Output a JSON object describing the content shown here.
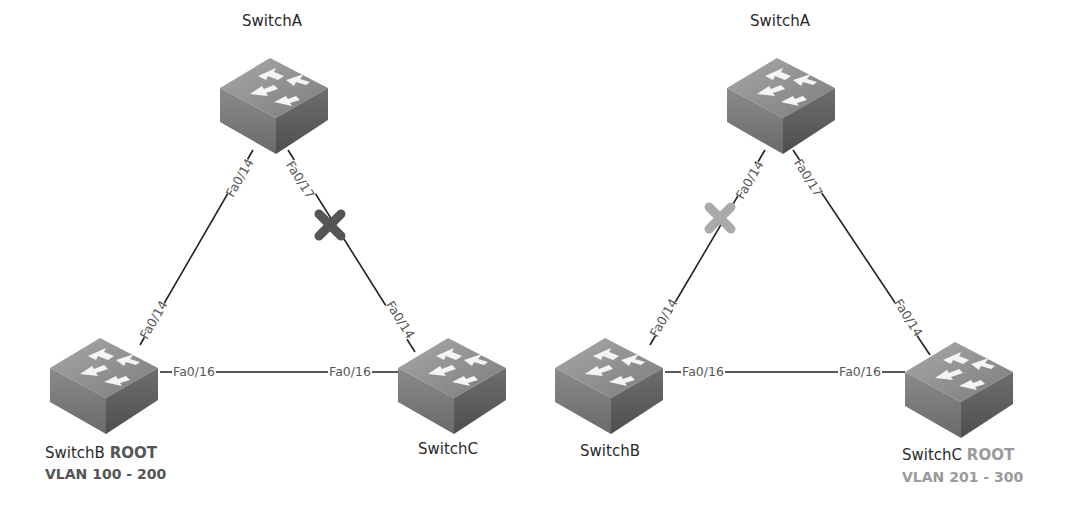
{
  "diagrams": [
    {
      "id": "left",
      "root_switch": "SwitchB",
      "root_vlan_range": "VLAN 100 - 200",
      "switches": [
        {
          "name": "SwitchA",
          "label": "SwitchA"
        },
        {
          "name": "SwitchB",
          "label": "SwitchB",
          "root_tag": "ROOT",
          "vlan": "VLAN 100 - 200"
        },
        {
          "name": "SwitchC",
          "label": "SwitchC"
        }
      ],
      "links": [
        {
          "from": "SwitchA",
          "from_port": "Fa0/14",
          "to": "SwitchB",
          "to_port": "Fa0/14",
          "blocked": false
        },
        {
          "from": "SwitchA",
          "from_port": "Fa0/17",
          "to": "SwitchC",
          "to_port": "Fa0/14",
          "blocked": true,
          "block_color": "#555555"
        },
        {
          "from": "SwitchB",
          "from_port": "Fa0/16",
          "to": "SwitchC",
          "to_port": "Fa0/16",
          "blocked": false
        }
      ]
    },
    {
      "id": "right",
      "root_switch": "SwitchC",
      "root_vlan_range": "VLAN 201 - 300",
      "switches": [
        {
          "name": "SwitchA",
          "label": "SwitchA"
        },
        {
          "name": "SwitchB",
          "label": "SwitchB"
        },
        {
          "name": "SwitchC",
          "label": "SwitchC",
          "root_tag": "ROOT",
          "vlan": "VLAN 201 - 300"
        }
      ],
      "links": [
        {
          "from": "SwitchA",
          "from_port": "Fa0/14",
          "to": "SwitchB",
          "to_port": "Fa0/14",
          "blocked": true,
          "block_color": "#aaaaaa"
        },
        {
          "from": "SwitchA",
          "from_port": "Fa0/17",
          "to": "SwitchC",
          "to_port": "Fa0/14",
          "blocked": false
        },
        {
          "from": "SwitchB",
          "from_port": "Fa0/16",
          "to": "SwitchC",
          "to_port": "Fa0/16",
          "blocked": false
        }
      ]
    }
  ],
  "colors": {
    "link": "#222222",
    "port_label": "#555555",
    "blocked_left": "#555555",
    "blocked_right": "#aaaaaa",
    "root_left": "#555555",
    "root_right": "#9a9a9a"
  }
}
